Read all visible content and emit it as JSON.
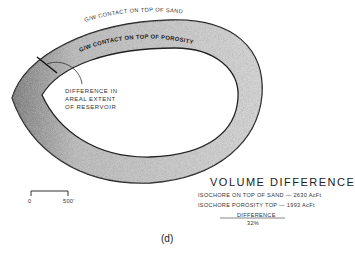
{
  "diagram": {
    "outer_label": "G/W CONTACT ON TOP OF SAND",
    "inner_label": "G/W CONTACT ON TOP OF POROSITY",
    "callout": "DIFFERENCE IN\nAREAL EXTENT\nOF RESERVOIR",
    "scale_bar": {
      "start": "0",
      "end": "500'"
    },
    "summary": {
      "title": "VOLUME DIFFERENCE",
      "line1": "ISOCHORE ON TOP OF SAND — 2630 AcFt",
      "line2": "ISOCHORE POROSITY TOP — 1993 AcFt",
      "difference_label": "DIFFERENCE",
      "difference_value": "32%"
    },
    "caption": "(d)"
  }
}
